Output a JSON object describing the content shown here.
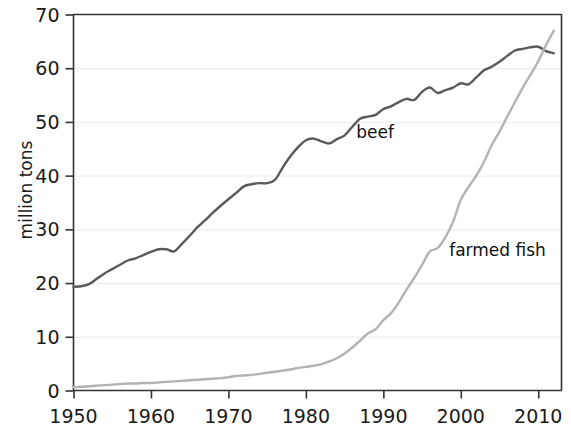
{
  "chart_data": {
    "type": "line",
    "title": "",
    "subtitle": "",
    "xlabel": "",
    "ylabel": "million tons",
    "xlim": [
      1950,
      2013
    ],
    "ylim": [
      0,
      70
    ],
    "xticks": [
      1950,
      1960,
      1970,
      1980,
      1990,
      2000,
      2010
    ],
    "xtick_labels": [
      "1950",
      "1960",
      "1970",
      "1980",
      "1990",
      "2000",
      "2010"
    ],
    "yticks": [
      0,
      10,
      20,
      30,
      40,
      50,
      60,
      70
    ],
    "ytick_labels": [
      "0",
      "10",
      "20",
      "30",
      "40",
      "50",
      "60",
      "70"
    ],
    "grid": true,
    "grid_axis": "y",
    "legend_position": "inline-annotation",
    "colors": {
      "beef": "#5a5a5a",
      "farmed_fish": "#b3b3b3",
      "axis": "#333333",
      "grid": "#efefef",
      "text": "#1a1a1a"
    },
    "annotations": [
      {
        "text": "beef",
        "x": 1986.5,
        "y": 47.0
      },
      {
        "text": "farmed fish",
        "x": 1998.5,
        "y": 25.0
      }
    ],
    "series": [
      {
        "name": "beef",
        "label": "beef",
        "color": "#5a5a5a",
        "x": [
          1950,
          1951,
          1952,
          1953,
          1954,
          1955,
          1956,
          1957,
          1958,
          1959,
          1960,
          1961,
          1962,
          1963,
          1964,
          1965,
          1966,
          1967,
          1968,
          1969,
          1970,
          1971,
          1972,
          1973,
          1974,
          1975,
          1976,
          1977,
          1978,
          1979,
          1980,
          1981,
          1982,
          1983,
          1984,
          1985,
          1986,
          1987,
          1988,
          1989,
          1990,
          1991,
          1992,
          1993,
          1994,
          1995,
          1996,
          1997,
          1998,
          1999,
          2000,
          2001,
          2002,
          2003,
          2004,
          2005,
          2006,
          2007,
          2008,
          2009,
          2010,
          2011,
          2012
        ],
        "values": [
          19.3,
          19.4,
          19.8,
          20.8,
          21.8,
          22.6,
          23.4,
          24.2,
          24.6,
          25.2,
          25.8,
          26.3,
          26.3,
          25.9,
          27.3,
          28.8,
          30.4,
          31.7,
          33.1,
          34.4,
          35.6,
          36.8,
          38.0,
          38.4,
          38.6,
          38.6,
          39.2,
          41.5,
          43.6,
          45.3,
          46.6,
          46.9,
          46.4,
          46.0,
          46.8,
          47.5,
          49.1,
          50.6,
          51.0,
          51.3,
          52.4,
          52.9,
          53.7,
          54.3,
          54.1,
          55.6,
          56.4,
          55.4,
          55.9,
          56.4,
          57.2,
          57.0,
          58.3,
          59.6,
          60.3,
          61.2,
          62.3,
          63.3,
          63.6,
          63.9,
          64.0,
          63.2,
          62.8
        ]
      },
      {
        "name": "farmed_fish",
        "label": "farmed fish",
        "color": "#b3b3b3",
        "x": [
          1950,
          1951,
          1952,
          1953,
          1954,
          1955,
          1956,
          1957,
          1958,
          1959,
          1960,
          1961,
          1962,
          1963,
          1964,
          1965,
          1966,
          1967,
          1968,
          1969,
          1970,
          1971,
          1972,
          1973,
          1974,
          1975,
          1976,
          1977,
          1978,
          1979,
          1980,
          1981,
          1982,
          1983,
          1984,
          1985,
          1986,
          1987,
          1988,
          1989,
          1990,
          1991,
          1992,
          1993,
          1994,
          1995,
          1996,
          1997,
          1998,
          1999,
          2000,
          2001,
          2002,
          2003,
          2004,
          2005,
          2006,
          2007,
          2008,
          2009,
          2010,
          2011,
          2012
        ],
        "values": [
          0.6,
          0.7,
          0.8,
          0.9,
          1.0,
          1.1,
          1.2,
          1.3,
          1.3,
          1.4,
          1.4,
          1.5,
          1.6,
          1.7,
          1.8,
          1.9,
          2.0,
          2.1,
          2.2,
          2.3,
          2.5,
          2.7,
          2.8,
          2.9,
          3.1,
          3.3,
          3.5,
          3.7,
          3.9,
          4.2,
          4.4,
          4.6,
          4.9,
          5.4,
          6.0,
          6.9,
          8.0,
          9.3,
          10.6,
          11.4,
          13.1,
          14.4,
          16.4,
          18.8,
          21.0,
          23.4,
          25.9,
          26.5,
          28.5,
          31.4,
          35.5,
          37.9,
          40.0,
          42.6,
          45.7,
          48.2,
          51.0,
          53.7,
          56.4,
          58.8,
          61.3,
          64.3,
          67.0
        ]
      }
    ]
  },
  "axis": {
    "ylabel": "million tons"
  }
}
